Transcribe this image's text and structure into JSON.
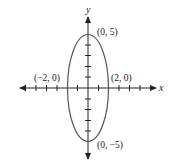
{
  "diagram": {
    "type": "ellipse-on-axes",
    "axes": {
      "x_label": "x",
      "y_label": "y"
    },
    "ellipse": {
      "center": [
        0,
        0
      ],
      "semi_axis_x": 2,
      "semi_axis_y": 5
    },
    "points": [
      {
        "label": "(0, 5)",
        "coords": [
          0,
          5
        ]
      },
      {
        "label": "(−2, 0)",
        "coords": [
          -2,
          0
        ]
      },
      {
        "label": "(2, 0)",
        "coords": [
          2,
          0
        ]
      },
      {
        "label": "(0, −5)",
        "coords": [
          0,
          -5
        ]
      }
    ],
    "ticks": {
      "x_range": [
        -6,
        6
      ],
      "y_range": [
        -5,
        5
      ],
      "step": 1
    },
    "colors": {
      "ellipse": "#555555",
      "axes": "#222222"
    }
  }
}
